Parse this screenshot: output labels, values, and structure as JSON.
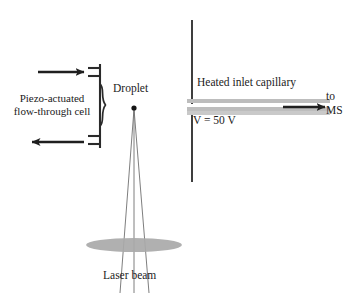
{
  "figure": {
    "background_color": "#ffffff",
    "width": 357,
    "height": 293
  },
  "labels": {
    "piezo_cell": "Piezo-actuated\nflow-through cell",
    "piezo_cell_line1": "Piezo-actuated",
    "piezo_cell_line2": "flow-through cell",
    "droplet": "Droplet",
    "heated_inlet_capillary": "Heated inlet capillary",
    "voltage": "V = 50 V",
    "to_ms_line1": "to",
    "to_ms_line2": "MS",
    "laser_beam": "Laser beam"
  },
  "colors": {
    "ink": "#1b1b1b",
    "stroke": "#2a2a2a",
    "capillary_fill": "#b9b9b9",
    "capillary_fill_light": "#c7c7c7",
    "lens_fill": "#a8a8a8",
    "ray": "#6b6b6b",
    "arrow": "#1f1f1f",
    "background": "#ffffff"
  },
  "geometry": {
    "droplet_point": {
      "x": 134,
      "y": 108
    },
    "piezo_wall_x": 100,
    "electrode_line": {
      "x": 192,
      "y_top": 20,
      "y_bottom": 182
    },
    "capillary": {
      "x_left": 187,
      "x_right": 330,
      "y_top": 99,
      "y_bottom": 115
    },
    "lens_ellipse": {
      "cx": 134,
      "cy": 245,
      "rx": 48,
      "ry": 7
    },
    "flow_arrow_in": {
      "x1": 38,
      "x2": 86,
      "y": 72
    },
    "flow_arrow_out": {
      "x1": 84,
      "x2": 30,
      "y": 142
    },
    "ms_arrow": {
      "x1": 283,
      "x2": 327,
      "y": 107
    }
  },
  "elements": {
    "droplet_dot": "droplet",
    "inlet_arrow": "arrow-right",
    "outlet_arrow": "arrow-left",
    "ms_arrow": "arrow-right",
    "brace": "curly-brace",
    "lens": "focusing-lens-ellipse",
    "beam_rays": 3
  }
}
